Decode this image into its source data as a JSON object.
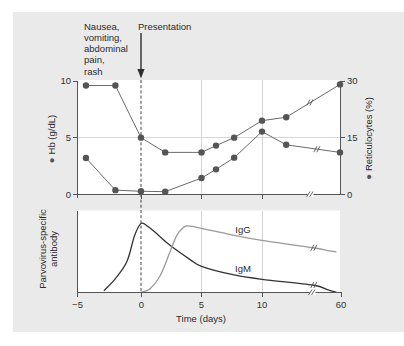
{
  "figure": {
    "annotations": {
      "symptoms_lines": [
        "Nausea,",
        "vomiting,",
        "abdominal",
        "pain,",
        "rash"
      ],
      "presentation": "Presentation"
    },
    "upper_panel": {
      "left_axis": {
        "marker": "●",
        "label": "Hb (g/dL)",
        "ticks": [
          "10",
          "5",
          "0"
        ]
      },
      "right_axis": {
        "marker": "●",
        "label": "Reticulocytes (%)",
        "ticks": [
          "30",
          "15",
          "0"
        ]
      }
    },
    "lower_panel": {
      "y_axis_label_lines": [
        "Parvovirus-specific",
        "antibody"
      ],
      "curve_labels": {
        "igg": "IgG",
        "igm": "IgM"
      }
    },
    "x_axis": {
      "ticks": [
        "−5",
        "0",
        "5",
        "10",
        "60"
      ],
      "label": "Time (days)"
    }
  },
  "colors": {
    "panel_background": "#eaeaea",
    "plot_background": "#ffffff",
    "marker": "#555555",
    "upper_lines": "#6a6a6a",
    "igm": "#333333",
    "igg": "#9a9a9a"
  },
  "chart_data": [
    {
      "type": "line",
      "panel": "upper",
      "title": "",
      "xlabel": "Time (days)",
      "x_ticks": [
        -5,
        0,
        5,
        10,
        60
      ],
      "x_axis_break": [
        12,
        60
      ],
      "y_left": {
        "label": "Hb (g/dL)",
        "lim": [
          0,
          10
        ],
        "ticks": [
          0,
          5,
          10
        ]
      },
      "y_right": {
        "label": "Reticulocytes (%)",
        "lim": [
          0,
          30
        ],
        "ticks": [
          0,
          15,
          30
        ]
      },
      "grid": {
        "vertical_at_x": [
          5,
          10
        ],
        "horizontal_at_y_left": [
          5
        ]
      },
      "reference_line": {
        "x": 0,
        "style": "dashed"
      },
      "annotations": [
        {
          "text": "Nausea, vomiting, abdominal pain, rash"
        },
        {
          "text": "Presentation",
          "x": 0,
          "arrow": true
        }
      ],
      "series": [
        {
          "name": "Hb (g/dL)",
          "axis": "left",
          "marker": "circle",
          "x": [
            -4.3,
            -2,
            0,
            2,
            5,
            6.2,
            7.7,
            10,
            12,
            60
          ],
          "values": [
            9.6,
            9.6,
            5.0,
            3.7,
            3.7,
            4.3,
            5.0,
            6.5,
            6.8,
            9.7
          ]
        },
        {
          "name": "Reticulocytes (%)",
          "axis": "right",
          "marker": "circle",
          "x": [
            -4.3,
            -2,
            0,
            2,
            5,
            6.2,
            7.7,
            10,
            12,
            60
          ],
          "values": [
            9.6,
            1.1,
            0.8,
            0.7,
            4.3,
            6.6,
            9.7,
            16.6,
            13.1,
            11.1
          ]
        }
      ]
    },
    {
      "type": "line",
      "panel": "lower",
      "title": "",
      "xlabel": "Time (days)",
      "ylabel": "Parvovirus-specific antibody",
      "x_ticks": [
        -5,
        0,
        5,
        10,
        60
      ],
      "x_axis_break": [
        14.2,
        55
      ],
      "ylim": [
        0,
        1
      ],
      "y_units": "relative (no scale shown)",
      "grid": {
        "vertical_at_x": [
          5,
          10
        ]
      },
      "reference_line": {
        "x": 0,
        "style": "dashed"
      },
      "series": [
        {
          "name": "IgM",
          "x": [
            -2.9,
            -2.0,
            -1.1,
            -0.5,
            0,
            0.6,
            1.4,
            2.4,
            4.0,
            5.0,
            7.5,
            10,
            14.2,
            55,
            58.5
          ],
          "values": [
            0.02,
            0.17,
            0.38,
            0.7,
            0.85,
            0.81,
            0.71,
            0.58,
            0.41,
            0.32,
            0.22,
            0.16,
            0.09,
            0.03,
            0.0
          ]
        },
        {
          "name": "IgG",
          "x": [
            0,
            0.75,
            1.6,
            2.4,
            2.95,
            3.5,
            3.9,
            5.0,
            7.5,
            10,
            14.2,
            55,
            58.5
          ],
          "values": [
            0.0,
            0.045,
            0.21,
            0.5,
            0.7,
            0.8,
            0.82,
            0.79,
            0.71,
            0.64,
            0.55,
            0.515,
            0.5
          ]
        }
      ]
    }
  ]
}
